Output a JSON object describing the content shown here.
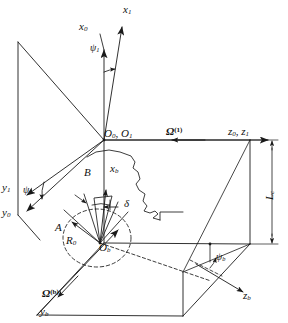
{
  "figure": {
    "type": "3d-coordinate-frame-diagram"
  },
  "labels": {
    "x0": {
      "base": "x",
      "sub": "0",
      "sup": ""
    },
    "x1": {
      "base": "x",
      "sub": "1",
      "sup": ""
    },
    "y0": {
      "base": "y",
      "sub": "0",
      "sup": ""
    },
    "y1": {
      "base": "y",
      "sub": "1",
      "sup": ""
    },
    "yb": {
      "base": "y",
      "sub": "b",
      "sup": ""
    },
    "xb": {
      "base": "x",
      "sub": "b",
      "sup": ""
    },
    "zb": {
      "base": "z",
      "sub": "b",
      "sup": ""
    },
    "z0z1": {
      "text": "z0, z1"
    },
    "O0O1": {
      "text": "O0, O1"
    },
    "Ob": {
      "base": "O",
      "sub": "b",
      "sup": ""
    },
    "psi1_top": {
      "base": "ψ",
      "sub": "1",
      "sup": ""
    },
    "psi1_left": {
      "base": "ψ",
      "sub": "1",
      "sup": ""
    },
    "psib": {
      "base": "ψ",
      "sub": "b",
      "sup": ""
    },
    "delta": {
      "base": "δ",
      "sub": "",
      "sup": ""
    },
    "A": {
      "text": "A"
    },
    "B": {
      "text": "B"
    },
    "R0": {
      "base": "R",
      "sub": "0",
      "sup": ""
    },
    "Omega1": {
      "base": "Ω",
      "sub": "",
      "sup": "(1)"
    },
    "Omegab": {
      "base": "Ω",
      "sub": "",
      "sup": "(b)"
    },
    "Lc": {
      "base": "L",
      "sub": "c",
      "sup": ""
    }
  },
  "colors": {
    "line": "#1a1a1a",
    "background": "#ffffff",
    "text": "#111111"
  },
  "geometry": {
    "origin_O0O1": [
      104,
      140
    ],
    "origin_Ob": [
      100,
      243
    ],
    "stroke_width": 0.9
  }
}
